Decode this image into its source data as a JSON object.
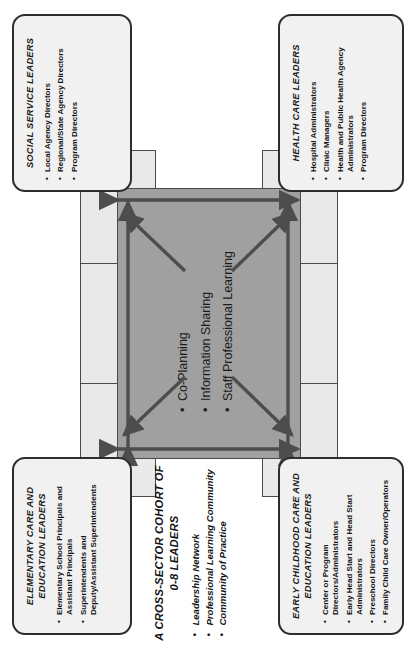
{
  "diagram": {
    "type": "cross-sector cohort framework",
    "orientation": "rotated 90 degrees counter-clockwise",
    "colors": {
      "core_fill": "#a0a0a0",
      "band_fill": "#e9e9e9",
      "box_fill": "#f1f1f1",
      "stroke": "#2d2d2d",
      "arrow": "#4d4d4d"
    }
  },
  "cohort": {
    "title_line1": "A CROSS-SECTOR COHORT OF",
    "title_line2": "0-8 LEADERS",
    "items": [
      "Leadership Network",
      "Professional Learning Community",
      "Community of Practice"
    ]
  },
  "core": {
    "items": [
      "Co-Planning",
      "Information Sharing",
      "Staff Professional Learning"
    ]
  },
  "boxes": {
    "top_left": {
      "title": "ELEMENTARY CARE AND EDUCATION  LEADERS",
      "items": [
        "Elementary School Principals and Assistant Principals",
        "Superintendents and Deputy/Assistant Superintendents"
      ]
    },
    "top_right": {
      "title": "SOCIAL SERVICE LEADERS",
      "items": [
        "Local Agency Directors",
        "Regional/State Agency Directors",
        "Program Directors"
      ]
    },
    "bottom_left": {
      "title": "EARLY CHILDHOOD CARE AND EDUCATION LEADERS",
      "items": [
        "Center or Program Directors/Administrators",
        "Early Head Start and Head Start Administrators",
        "Preschool Directors",
        "Family Child Care Owner/Operators"
      ]
    },
    "bottom_right": {
      "title": "HEALTH CARE LEADERS",
      "items": [
        "Hospital Administrators",
        "Clinic Managers",
        "Health and Public Health Agency Administrators",
        "Program Directors"
      ]
    }
  }
}
